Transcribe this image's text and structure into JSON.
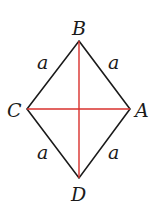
{
  "diagram": {
    "type": "rhombus",
    "vertices": [
      {
        "name": "B",
        "x": 79,
        "y": 41
      },
      {
        "name": "A",
        "x": 130,
        "y": 109
      },
      {
        "name": "D",
        "x": 79,
        "y": 178
      },
      {
        "name": "C",
        "x": 27,
        "y": 109
      }
    ],
    "side_labels": [
      "a",
      "a",
      "a",
      "a"
    ],
    "edge_color": "#1a1a1a",
    "diagonal_color": "#d9302c",
    "diagonals": [
      "BD",
      "CA"
    ]
  },
  "labels": {
    "B": "B",
    "A": "A",
    "C": "C",
    "D": "D",
    "side_top_left": "a",
    "side_top_right": "a",
    "side_bottom_left": "a",
    "side_bottom_right": "a"
  }
}
